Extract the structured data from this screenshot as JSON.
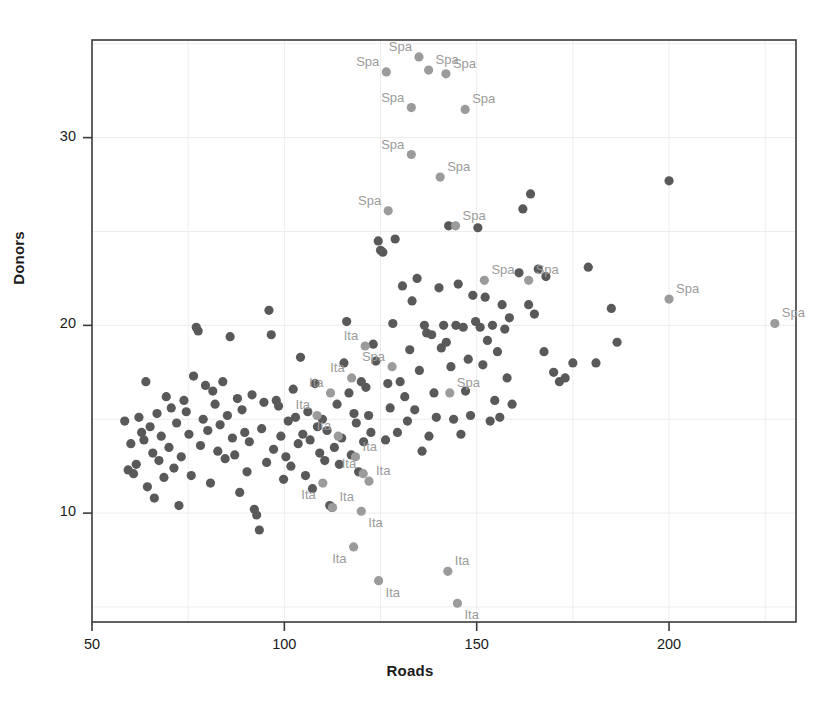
{
  "chart_data": {
    "type": "scatter",
    "title": "",
    "xlabel": "Roads",
    "ylabel": "Donors",
    "xlim": [
      50,
      233
    ],
    "ylim": [
      4.2,
      35.2
    ],
    "xticks": [
      50,
      100,
      150,
      200
    ],
    "xtick_labels": [
      "50",
      "100",
      "150",
      "200"
    ],
    "yticks": [
      10,
      20,
      30
    ],
    "ytick_labels": [
      "10",
      "20",
      "30"
    ],
    "x_minor_gridlines": [
      75,
      125,
      175,
      225
    ],
    "y_minor_gridlines": [
      5,
      15,
      25,
      35
    ],
    "grid": true,
    "legend": null,
    "colors": {
      "unlabeled_point": "#595959",
      "labeled_point": "#9b9b9b",
      "label_text": "#9b9b9b",
      "axis": "#3a3a3a",
      "gridline": "#ededed",
      "background": "#ffffff"
    },
    "point_radius": 4.6,
    "series": [
      {
        "name": "unlabeled",
        "label": "",
        "color": "#595959",
        "points": [
          [
            58.5,
            14.9
          ],
          [
            59.4,
            12.3
          ],
          [
            60.1,
            13.7
          ],
          [
            60.8,
            12.1
          ],
          [
            61.5,
            12.6
          ],
          [
            62.2,
            15.1
          ],
          [
            62.9,
            14.3
          ],
          [
            63.5,
            13.9
          ],
          [
            64.0,
            17.0
          ],
          [
            64.4,
            11.4
          ],
          [
            65.1,
            14.6
          ],
          [
            65.8,
            13.2
          ],
          [
            66.2,
            10.8
          ],
          [
            66.9,
            15.3
          ],
          [
            67.4,
            12.8
          ],
          [
            68.0,
            14.1
          ],
          [
            68.7,
            11.9
          ],
          [
            69.3,
            16.2
          ],
          [
            70.0,
            13.5
          ],
          [
            70.6,
            15.6
          ],
          [
            71.3,
            12.4
          ],
          [
            72.0,
            14.8
          ],
          [
            72.6,
            10.4
          ],
          [
            73.2,
            13.0
          ],
          [
            73.9,
            16.0
          ],
          [
            74.5,
            15.4
          ],
          [
            75.2,
            14.2
          ],
          [
            75.8,
            12.0
          ],
          [
            76.4,
            17.3
          ],
          [
            77.1,
            19.9
          ],
          [
            77.6,
            19.7
          ],
          [
            78.2,
            13.6
          ],
          [
            78.9,
            15.0
          ],
          [
            79.5,
            16.8
          ],
          [
            80.1,
            14.4
          ],
          [
            80.8,
            11.6
          ],
          [
            81.4,
            16.5
          ],
          [
            82.0,
            15.8
          ],
          [
            82.7,
            13.3
          ],
          [
            83.3,
            14.7
          ],
          [
            84.0,
            17.0
          ],
          [
            84.6,
            12.9
          ],
          [
            85.2,
            15.2
          ],
          [
            85.9,
            19.4
          ],
          [
            86.5,
            14.0
          ],
          [
            87.1,
            13.1
          ],
          [
            87.8,
            16.1
          ],
          [
            88.4,
            11.1
          ],
          [
            89.0,
            15.5
          ],
          [
            89.7,
            14.3
          ],
          [
            90.3,
            12.2
          ],
          [
            90.9,
            13.8
          ],
          [
            91.6,
            16.3
          ],
          [
            92.2,
            10.2
          ],
          [
            92.8,
            9.9
          ],
          [
            93.5,
            9.1
          ],
          [
            94.1,
            14.5
          ],
          [
            94.7,
            15.9
          ],
          [
            95.4,
            12.7
          ],
          [
            96.0,
            20.8
          ],
          [
            96.6,
            19.5
          ],
          [
            97.2,
            13.4
          ],
          [
            97.9,
            16.0
          ],
          [
            98.5,
            15.7
          ],
          [
            99.1,
            14.1
          ],
          [
            99.8,
            11.8
          ],
          [
            100.4,
            13.0
          ],
          [
            101.0,
            14.9
          ],
          [
            101.7,
            12.5
          ],
          [
            102.3,
            16.6
          ],
          [
            102.9,
            15.1
          ],
          [
            103.6,
            13.7
          ],
          [
            104.2,
            18.3
          ],
          [
            104.8,
            14.2
          ],
          [
            105.5,
            12.0
          ],
          [
            106.1,
            15.4
          ],
          [
            106.7,
            13.9
          ],
          [
            107.3,
            11.3
          ],
          [
            108.0,
            16.9
          ],
          [
            108.6,
            14.6
          ],
          [
            109.2,
            13.2
          ],
          [
            109.9,
            15.0
          ],
          [
            110.5,
            12.8
          ],
          [
            111.1,
            14.4
          ],
          [
            111.8,
            10.4
          ],
          [
            112.4,
            10.3
          ],
          [
            113.0,
            13.5
          ],
          [
            113.7,
            15.8
          ],
          [
            114.3,
            12.6
          ],
          [
            114.9,
            14.0
          ],
          [
            115.5,
            18.0
          ],
          [
            116.2,
            20.2
          ],
          [
            116.8,
            16.4
          ],
          [
            117.4,
            13.1
          ],
          [
            118.1,
            15.3
          ],
          [
            118.7,
            14.8
          ],
          [
            119.3,
            12.2
          ],
          [
            120.0,
            17.0
          ],
          [
            120.6,
            13.8
          ],
          [
            121.2,
            16.7
          ],
          [
            121.9,
            15.2
          ],
          [
            122.5,
            14.3
          ],
          [
            123.1,
            19.0
          ],
          [
            123.8,
            18.1
          ],
          [
            124.4,
            24.5
          ],
          [
            125.0,
            24.0
          ],
          [
            125.6,
            23.9
          ],
          [
            126.3,
            13.9
          ],
          [
            126.9,
            16.9
          ],
          [
            127.5,
            15.6
          ],
          [
            128.2,
            20.1
          ],
          [
            128.8,
            24.6
          ],
          [
            129.4,
            14.3
          ],
          [
            130.1,
            17.0
          ],
          [
            130.7,
            22.1
          ],
          [
            131.3,
            16.2
          ],
          [
            132.0,
            14.9
          ],
          [
            132.6,
            18.7
          ],
          [
            133.2,
            21.3
          ],
          [
            133.9,
            15.5
          ],
          [
            134.5,
            22.5
          ],
          [
            135.1,
            17.6
          ],
          [
            135.8,
            13.3
          ],
          [
            136.4,
            20.0
          ],
          [
            137.0,
            19.6
          ],
          [
            137.6,
            14.1
          ],
          [
            138.3,
            19.5
          ],
          [
            138.9,
            16.4
          ],
          [
            139.5,
            15.1
          ],
          [
            140.2,
            22.0
          ],
          [
            140.8,
            18.8
          ],
          [
            141.4,
            20.0
          ],
          [
            142.1,
            19.1
          ],
          [
            142.7,
            25.3
          ],
          [
            143.3,
            17.8
          ],
          [
            144.0,
            15.0
          ],
          [
            144.6,
            20.0
          ],
          [
            145.2,
            22.2
          ],
          [
            145.9,
            14.2
          ],
          [
            146.5,
            19.9
          ],
          [
            147.1,
            16.5
          ],
          [
            147.8,
            18.2
          ],
          [
            148.4,
            15.2
          ],
          [
            149.0,
            21.6
          ],
          [
            149.7,
            20.2
          ],
          [
            150.3,
            25.2
          ],
          [
            150.9,
            19.9
          ],
          [
            151.6,
            17.9
          ],
          [
            152.2,
            21.5
          ],
          [
            152.8,
            19.2
          ],
          [
            153.5,
            14.9
          ],
          [
            154.1,
            20.0
          ],
          [
            154.7,
            16.0
          ],
          [
            155.4,
            18.6
          ],
          [
            156.0,
            15.1
          ],
          [
            156.6,
            21.1
          ],
          [
            157.3,
            19.8
          ],
          [
            157.9,
            17.2
          ],
          [
            158.5,
            20.4
          ],
          [
            159.2,
            15.8
          ],
          [
            161.0,
            22.8
          ],
          [
            162.0,
            26.2
          ],
          [
            163.5,
            21.1
          ],
          [
            164.0,
            27.0
          ],
          [
            165.0,
            20.6
          ],
          [
            166.0,
            23.0
          ],
          [
            167.5,
            18.6
          ],
          [
            168.0,
            22.6
          ],
          [
            170.0,
            17.5
          ],
          [
            171.5,
            17.0
          ],
          [
            173.0,
            17.2
          ],
          [
            175.0,
            18.0
          ],
          [
            179.0,
            23.1
          ],
          [
            181.0,
            18.0
          ],
          [
            185.0,
            20.9
          ],
          [
            186.5,
            19.1
          ],
          [
            200.0,
            27.7
          ]
        ]
      },
      {
        "name": "Spain",
        "label": "Spa",
        "color": "#9b9b9b",
        "label_color": "#9b9b9b",
        "points": [
          [
            126.5,
            33.5
          ],
          [
            135.0,
            34.3
          ],
          [
            137.5,
            33.6
          ],
          [
            142.0,
            33.4
          ],
          [
            133.0,
            31.6
          ],
          [
            147.0,
            31.5
          ],
          [
            133.0,
            29.1
          ],
          [
            140.5,
            27.9
          ],
          [
            127.0,
            26.1
          ],
          [
            144.5,
            25.3
          ],
          [
            152.0,
            22.4
          ],
          [
            163.5,
            22.4
          ],
          [
            200.0,
            21.4
          ],
          [
            227.5,
            20.1
          ],
          [
            128.0,
            17.8
          ],
          [
            143.0,
            16.4
          ]
        ],
        "label_positions": [
          "above-left",
          "above-left",
          "above-right",
          "above-right",
          "above-left",
          "above-right",
          "above-left",
          "above-right",
          "above-left",
          "above-right",
          "above-right",
          "above-right",
          "above-right",
          "above-right",
          "above-left",
          "above-right"
        ]
      },
      {
        "name": "Italy",
        "label": "Ita",
        "color": "#9b9b9b",
        "label_color": "#9b9b9b",
        "points": [
          [
            121.0,
            18.9
          ],
          [
            112.0,
            16.4
          ],
          [
            117.5,
            17.2
          ],
          [
            108.5,
            15.2
          ],
          [
            114.0,
            14.1
          ],
          [
            118.5,
            13.0
          ],
          [
            120.5,
            12.1
          ],
          [
            110.0,
            11.6
          ],
          [
            112.5,
            10.3
          ],
          [
            122.0,
            11.7
          ],
          [
            120.0,
            10.1
          ],
          [
            118.0,
            8.2
          ],
          [
            124.5,
            6.4
          ],
          [
            142.5,
            6.9
          ],
          [
            145.0,
            5.2
          ]
        ],
        "label_positions": [
          "above-left",
          "above-left",
          "above-left",
          "above-left",
          "above-left",
          "above-right",
          "above-left",
          "below-left",
          "above-right",
          "above-right",
          "below-right",
          "below-left",
          "below-right",
          "above-right",
          "below-right"
        ]
      }
    ]
  },
  "axes": {
    "x_title": "Roads",
    "y_title": "Donors"
  }
}
